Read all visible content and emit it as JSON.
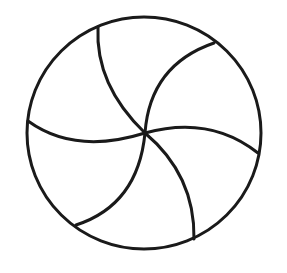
{
  "diagram": {
    "stroke_color": "#1a1a1a",
    "background": "#ffffff",
    "segments": 6
  }
}
